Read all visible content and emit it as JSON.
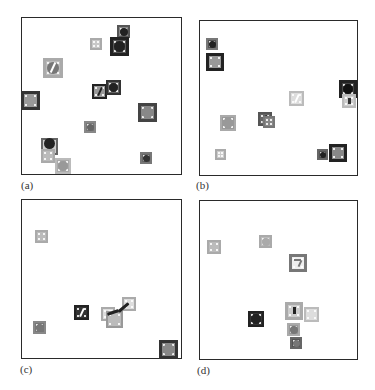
{
  "figure": {
    "panels": [
      {
        "id": "a",
        "label": "(a)",
        "frame": {
          "x": 21,
          "y": 17,
          "w": 161,
          "h": 158
        },
        "label_pos": {
          "x": 21,
          "y": 179
        },
        "objects": [
          {
            "type": "square-circle",
            "x": 117,
            "y": 25,
            "size": 13,
            "frame": "#555",
            "fill": "#888",
            "circle": "#222"
          },
          {
            "type": "square-circle",
            "x": 110,
            "y": 37,
            "size": 19,
            "frame": "#222",
            "fill": "#555",
            "circle": "#222"
          },
          {
            "type": "square",
            "x": 90,
            "y": 38,
            "size": 12,
            "frame": "#aaa",
            "fill": "#c8c8c8"
          },
          {
            "type": "square-circle-slash",
            "x": 43,
            "y": 58,
            "size": 20,
            "frame": "#aaa",
            "fill": "#bbb",
            "circle": "#777"
          },
          {
            "type": "square-slash",
            "x": 92,
            "y": 84,
            "size": 15,
            "frame": "#222",
            "fill": "#999",
            "stroke": "#222"
          },
          {
            "type": "square-circle",
            "x": 106,
            "y": 80,
            "size": 15,
            "frame": "#333",
            "fill": "#666",
            "circle": "#222"
          },
          {
            "type": "square",
            "x": 21,
            "y": 91,
            "size": 19,
            "frame": "#333",
            "fill": "#999"
          },
          {
            "type": "square-circle",
            "x": 138,
            "y": 103,
            "size": 19,
            "frame": "#444",
            "fill": "#888",
            "circle": "#888"
          },
          {
            "type": "square-circle",
            "x": 84,
            "y": 121,
            "size": 12,
            "frame": "#888",
            "fill": "#777",
            "circle": "#666"
          },
          {
            "type": "square-circle",
            "x": 41,
            "y": 138,
            "size": 17,
            "frame": "#666",
            "fill": "#ccc",
            "circle": "#222",
            "circle_offset_y": -3
          },
          {
            "type": "square",
            "x": 41,
            "y": 149,
            "size": 14,
            "frame": "#aaa",
            "fill": "#bbb"
          },
          {
            "type": "square-circle",
            "x": 55,
            "y": 158,
            "size": 16,
            "frame": "#bbb",
            "fill": "#aaa",
            "circle": "#999"
          },
          {
            "type": "square-circle",
            "x": 140,
            "y": 152,
            "size": 12,
            "frame": "#777",
            "fill": "#666",
            "circle": "#333"
          }
        ]
      },
      {
        "id": "b",
        "label": "(b)",
        "frame": {
          "x": 199,
          "y": 20,
          "w": 159,
          "h": 156
        },
        "label_pos": {
          "x": 196,
          "y": 179
        },
        "objects": [
          {
            "type": "square-circle",
            "x": 206,
            "y": 38,
            "size": 12,
            "frame": "#777",
            "fill": "#555",
            "circle": "#222"
          },
          {
            "type": "square",
            "x": 206,
            "y": 53,
            "size": 18,
            "frame": "#222",
            "fill": "#999"
          },
          {
            "type": "square-slash-light",
            "x": 289,
            "y": 91,
            "size": 15,
            "frame": "#bbb",
            "fill": "#ddd",
            "stroke": "#fff"
          },
          {
            "type": "square-circle",
            "x": 339,
            "y": 80,
            "size": 18,
            "frame": "#222",
            "fill": "#444",
            "circle": "#111"
          },
          {
            "type": "square-key",
            "x": 342,
            "y": 94,
            "size": 14,
            "frame": "#bbb",
            "fill": "#ccc",
            "stroke": "#333"
          },
          {
            "type": "square-circle",
            "x": 220,
            "y": 115,
            "size": 16,
            "frame": "#aaa",
            "fill": "#999",
            "circle": "#999"
          },
          {
            "type": "square-slash",
            "x": 258,
            "y": 112,
            "size": 14,
            "frame": "#555",
            "fill": "#666",
            "stroke": "#222"
          },
          {
            "type": "square",
            "x": 263,
            "y": 116,
            "size": 12,
            "frame": "#777",
            "fill": "#888"
          },
          {
            "type": "square",
            "x": 215,
            "y": 149,
            "size": 11,
            "frame": "#aaa",
            "fill": "#ccc"
          },
          {
            "type": "square-circle",
            "x": 317,
            "y": 149,
            "size": 11,
            "frame": "#666",
            "fill": "#555",
            "circle": "#222"
          },
          {
            "type": "square",
            "x": 329,
            "y": 144,
            "size": 18,
            "frame": "#222",
            "fill": "#888"
          }
        ]
      },
      {
        "id": "c",
        "label": "(c)",
        "frame": {
          "x": 21,
          "y": 199,
          "w": 161,
          "h": 160
        },
        "label_pos": {
          "x": 20,
          "y": 363
        },
        "objects": [
          {
            "type": "square",
            "x": 35,
            "y": 230,
            "size": 13,
            "frame": "#aaa",
            "fill": "#bbb"
          },
          {
            "type": "square-slash",
            "x": 74,
            "y": 305,
            "size": 15,
            "frame": "#222",
            "fill": "#333",
            "stroke": "#fff",
            "circle": "#888"
          },
          {
            "type": "square-slash-light",
            "x": 101,
            "y": 307,
            "size": 14,
            "frame": "#aaa",
            "fill": "#ddd",
            "stroke": "#fff"
          },
          {
            "type": "square",
            "x": 106,
            "y": 311,
            "size": 17,
            "frame": "#999",
            "fill": "#bbb"
          },
          {
            "type": "square",
            "x": 122,
            "y": 297,
            "size": 14,
            "frame": "#aaa",
            "fill": "#ddd"
          },
          {
            "type": "arm-stroke",
            "x": 107,
            "y": 302,
            "w": 27,
            "h": 15
          },
          {
            "type": "square-circle",
            "x": 33,
            "y": 321,
            "size": 13,
            "frame": "#888",
            "fill": "#777",
            "circle": "#777"
          },
          {
            "type": "square-circle",
            "x": 159,
            "y": 340,
            "size": 19,
            "frame": "#333",
            "fill": "#888",
            "circle": "#888"
          }
        ]
      },
      {
        "id": "d",
        "label": "(d)",
        "frame": {
          "x": 199,
          "y": 200,
          "w": 159,
          "h": 160
        },
        "label_pos": {
          "x": 197,
          "y": 364
        },
        "objects": [
          {
            "type": "square",
            "x": 207,
            "y": 240,
            "size": 14,
            "frame": "#aaa",
            "fill": "#bbb"
          },
          {
            "type": "square-circle",
            "x": 259,
            "y": 235,
            "size": 13,
            "frame": "#aaa",
            "fill": "#bbb",
            "circle": "#aaa"
          },
          {
            "type": "square-seven",
            "x": 289,
            "y": 254,
            "size": 18,
            "frame": "#777",
            "fill": "#eee",
            "stroke": "#777"
          },
          {
            "type": "square-circle",
            "x": 287,
            "y": 323,
            "size": 13,
            "frame": "#aaa",
            "fill": "#999",
            "circle": "#777"
          },
          {
            "type": "square-bar",
            "x": 285,
            "y": 302,
            "size": 18,
            "frame": "#aaa",
            "fill": "#ccc",
            "stroke": "#222"
          },
          {
            "type": "square",
            "x": 304,
            "y": 307,
            "size": 15,
            "frame": "#bbb",
            "fill": "#ddd"
          },
          {
            "type": "square-circle",
            "x": 248,
            "y": 311,
            "size": 16,
            "frame": "#222",
            "fill": "#333",
            "circle": "#222"
          },
          {
            "type": "square-circle",
            "x": 290,
            "y": 337,
            "size": 12,
            "frame": "#666",
            "fill": "#555",
            "circle": "#777"
          }
        ]
      }
    ]
  }
}
